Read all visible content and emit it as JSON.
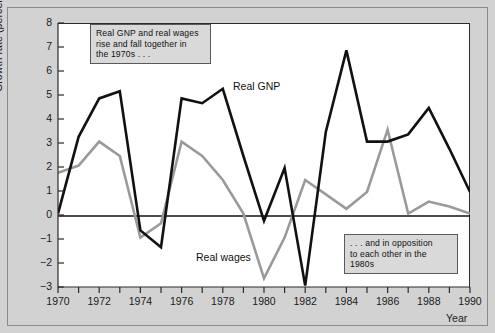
{
  "chart_data": {
    "type": "line",
    "title": "",
    "xlabel": "Year",
    "ylabel": "Growth rate (percent per year)",
    "x": [
      1970,
      1971,
      1972,
      1973,
      1974,
      1975,
      1976,
      1977,
      1978,
      1979,
      1980,
      1981,
      1982,
      1983,
      1984,
      1985,
      1986,
      1987,
      1988,
      1989,
      1990
    ],
    "xlim": [
      1970,
      1990
    ],
    "ylim": [
      -3,
      8
    ],
    "xticks": [
      1970,
      1971,
      1972,
      1973,
      1974,
      1975,
      1976,
      1977,
      1978,
      1979,
      1980,
      1981,
      1982,
      1983,
      1984,
      1985,
      1986,
      1987,
      1988,
      1989,
      1990
    ],
    "xtick_labels": [
      "1970",
      "",
      "1972",
      "",
      "1974",
      "",
      "1976",
      "",
      "1978",
      "",
      "1980",
      "",
      "1982",
      "",
      "1984",
      "",
      "1986",
      "",
      "1988",
      "",
      "1990"
    ],
    "yticks": [
      -3,
      -2,
      -1,
      0,
      1,
      2,
      3,
      4,
      5,
      6,
      7,
      8
    ],
    "ytick_labels": [
      "-3",
      "-2",
      "-1",
      "0",
      "1",
      "2",
      "3",
      "4",
      "5",
      "6",
      "7",
      "8"
    ],
    "grid": false,
    "legend_position": "inline-labels",
    "zero_line": 0,
    "series": [
      {
        "name": "Real GNP",
        "color": "#111111",
        "values": [
          0.1,
          3.3,
          4.9,
          5.2,
          -0.6,
          -1.3,
          4.9,
          4.7,
          5.3,
          2.5,
          -0.2,
          2.0,
          -2.9,
          3.5,
          6.9,
          3.1,
          3.1,
          3.4,
          4.5,
          2.8,
          1.0
        ]
      },
      {
        "name": "Real wages",
        "color": "#9a9a9a",
        "values": [
          1.8,
          2.1,
          3.1,
          2.5,
          -0.9,
          -0.3,
          3.1,
          2.5,
          1.5,
          0.1,
          -2.6,
          -0.9,
          1.5,
          0.9,
          0.3,
          1.0,
          3.6,
          0.1,
          0.6,
          0.4,
          0.1
        ]
      }
    ],
    "annotations": [
      {
        "id": "note-1",
        "text": "Real GNP and real wages rise and fall together in the 1970s . . ."
      },
      {
        "id": "note-2",
        "text": ". . . and in opposition to each other in the 1980s"
      }
    ]
  },
  "axes": {
    "y_axis_title": "Growth rate (percent per year)",
    "x_axis_title": "Year"
  },
  "labels": {
    "series_gnp": "Real GNP",
    "series_wages": "Real wages"
  },
  "notes": {
    "note_1_line_1": "Real GNP and real wages",
    "note_1_line_2": "rise and fall together in",
    "note_1_line_3": "the 1970s . . .",
    "note_2_line_1": ". . . and in opposition",
    "note_2_line_2": "to each other in the",
    "note_2_line_3": "1980s"
  },
  "colors": {
    "gnp_line": "#111111",
    "wages_line": "#9a9a9a",
    "panel_background": "#ffffff",
    "figure_background": "#d2d2d2",
    "annotation_background": "#d9d9d9"
  }
}
